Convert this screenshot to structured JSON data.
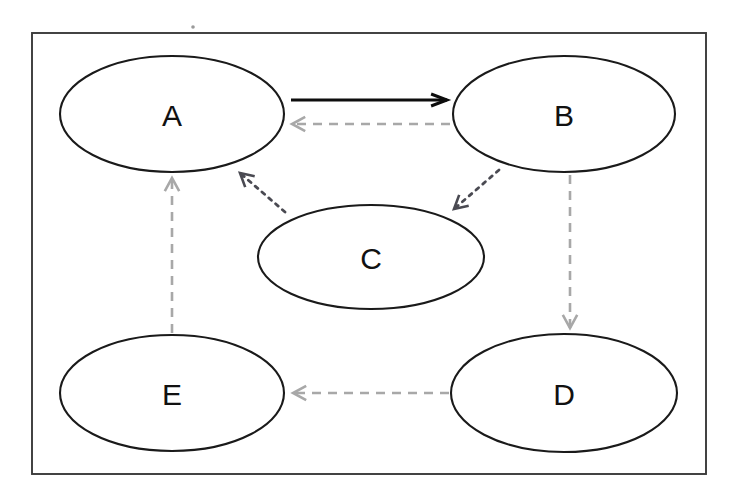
{
  "diagram": {
    "canvas": {
      "width": 736,
      "height": 500,
      "background": "#ffffff"
    },
    "frame": {
      "name": "diagram-border",
      "x": 32,
      "y": 33,
      "width": 674,
      "height": 441,
      "stroke": "#3a3a3a"
    },
    "colors": {
      "node_stroke": "#1a1a1a",
      "node_fill": "#ffffff",
      "label_text": "#111111",
      "solid_edge": "#0d0d0d",
      "dashed_edge": "#a8a8a8",
      "dotted_edge": "#4a4a52"
    },
    "nodes": [
      {
        "id": "A",
        "label": "A",
        "cx": 172,
        "cy": 114,
        "rx": 112,
        "ry": 58
      },
      {
        "id": "B",
        "label": "B",
        "cx": 564,
        "cy": 114,
        "rx": 111,
        "ry": 58
      },
      {
        "id": "C",
        "label": "C",
        "cx": 371,
        "cy": 257,
        "rx": 113,
        "ry": 52
      },
      {
        "id": "E",
        "label": "E",
        "cx": 172,
        "cy": 393,
        "rx": 112,
        "ry": 58
      },
      {
        "id": "D",
        "label": "D",
        "cx": 564,
        "cy": 393,
        "rx": 113,
        "ry": 59
      }
    ],
    "edges": [
      {
        "id": "A-to-B",
        "from": "A",
        "to": "B",
        "style": "solid",
        "color": "#0d0d0d",
        "x1": 291,
        "y1": 100,
        "x2": 447,
        "y2": 100,
        "arrowhead": "end"
      },
      {
        "id": "B-to-A",
        "from": "B",
        "to": "A",
        "style": "dashed",
        "color": "#a8a8a8",
        "x1": 450,
        "y1": 124,
        "x2": 292,
        "y2": 124,
        "arrowhead": "end"
      },
      {
        "id": "B-to-C",
        "from": "B",
        "to": "C",
        "style": "dotted",
        "color": "#4a4a52",
        "x1": 499,
        "y1": 170,
        "x2": 454,
        "y2": 209,
        "arrowhead": "end"
      },
      {
        "id": "C-to-A",
        "from": "C",
        "to": "A",
        "style": "dotted",
        "color": "#4a4a52",
        "x1": 285,
        "y1": 212,
        "x2": 240,
        "y2": 173,
        "arrowhead": "end"
      },
      {
        "id": "B-to-D",
        "from": "B",
        "to": "D",
        "style": "dashed",
        "color": "#a8a8a8",
        "x1": 570,
        "y1": 175,
        "x2": 570,
        "y2": 328,
        "arrowhead": "end"
      },
      {
        "id": "D-to-E",
        "from": "D",
        "to": "E",
        "style": "dashed",
        "color": "#a8a8a8",
        "x1": 449,
        "y1": 393,
        "x2": 293,
        "y2": 393,
        "arrowhead": "end"
      },
      {
        "id": "E-to-A",
        "from": "E",
        "to": "A",
        "style": "dashed",
        "color": "#a8a8a8",
        "x1": 172,
        "y1": 333,
        "x2": 172,
        "y2": 178,
        "arrowhead": "end"
      }
    ],
    "artifacts": [
      {
        "id": "scan-speck",
        "cx": 193,
        "cy": 27,
        "r": 1.8
      }
    ]
  }
}
